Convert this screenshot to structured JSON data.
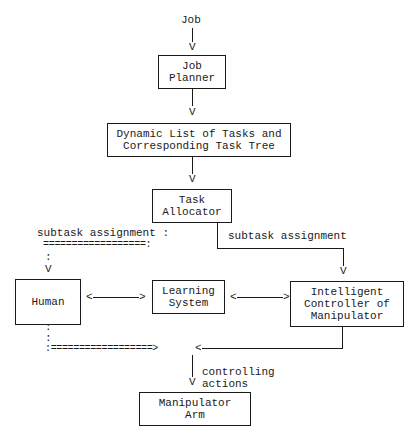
{
  "diagram": {
    "input_label": "Job",
    "nodes": {
      "job_planner": "Job\nPlanner",
      "task_list": "Dynamic List of Tasks and\nCorresponding Task Tree",
      "task_allocator": "Task\nAllocator",
      "human": "Human",
      "learning_system": "Learning\nSystem",
      "controller": "Intelligent\nController of\nManipulator",
      "manipulator_arm": "Manipulator\nArm"
    },
    "edges": {
      "left_subtask_label": "subtask assignment :",
      "left_subtask_dashes": "==================:",
      "left_colon": ":",
      "right_subtask_label": "subtask assignment",
      "human_learning_arrow": "<------------>",
      "learning_controller_arrow": "<----------->",
      "human_down_colon_1": ":",
      "human_down_colon_2": ":",
      "merge_dashes": ":==================>",
      "merge_left_arrowhead": "<",
      "controlling_label": "controlling\nactions"
    },
    "arrow_glyph": "V"
  }
}
